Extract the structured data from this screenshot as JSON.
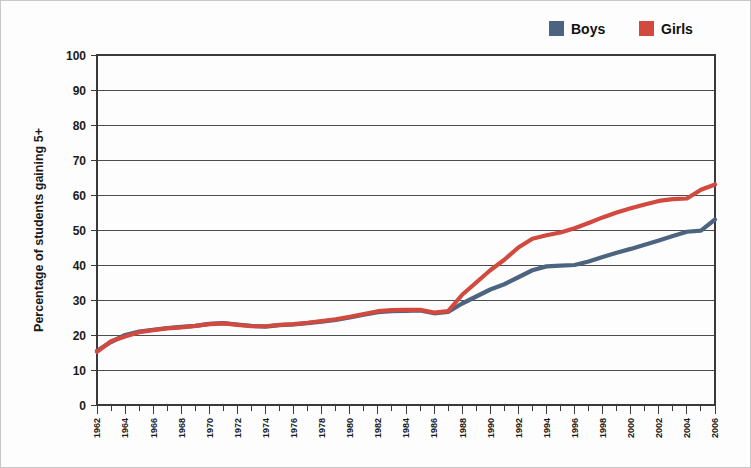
{
  "chart_data": {
    "type": "line",
    "title": "",
    "xlabel": "",
    "ylabel": "Percentage of students gaining 5+",
    "ylim": [
      0,
      100
    ],
    "xlim": [
      1962,
      2006
    ],
    "ytick_step": 10,
    "yticks": [
      0,
      10,
      20,
      30,
      40,
      50,
      60,
      70,
      80,
      90,
      100
    ],
    "grid": true,
    "legend_position": "top-right",
    "x": [
      1962,
      1963,
      1964,
      1965,
      1966,
      1967,
      1968,
      1969,
      1970,
      1971,
      1972,
      1973,
      1974,
      1975,
      1976,
      1977,
      1978,
      1979,
      1980,
      1981,
      1982,
      1983,
      1984,
      1985,
      1986,
      1987,
      1988,
      1989,
      1990,
      1991,
      1992,
      1993,
      1994,
      1995,
      1996,
      1997,
      1998,
      1999,
      2000,
      2001,
      2002,
      2003,
      2004,
      2005,
      2006
    ],
    "xticks_labeled": [
      "1962",
      "1964",
      "1966",
      "1968",
      "1970",
      "1972",
      "1974",
      "1976",
      "1978",
      "1980",
      "1982",
      "1984",
      "1986",
      "1988",
      "1990",
      "1992",
      "1994",
      "1996",
      "1998",
      "2000",
      "2002",
      "2004",
      "2006"
    ],
    "series": [
      {
        "name": "Boys",
        "color": "#4d6480",
        "values": [
          15.5,
          18.0,
          20.0,
          21.0,
          21.5,
          22.0,
          22.3,
          22.6,
          23.2,
          23.4,
          23.0,
          22.6,
          22.4,
          22.8,
          23.0,
          23.4,
          23.8,
          24.3,
          25.0,
          25.8,
          26.5,
          26.8,
          26.9,
          27.0,
          26.2,
          26.6,
          29.0,
          31.0,
          33.0,
          34.5,
          36.5,
          38.5,
          39.6,
          39.8,
          40.0,
          41.0,
          42.3,
          43.5,
          44.6,
          45.8,
          47.0,
          48.3,
          49.5,
          49.8,
          53.0
        ]
      },
      {
        "name": "Girls",
        "color": "#c7ララ",
        "values": [
          15.2,
          18.2,
          19.6,
          20.8,
          21.4,
          21.9,
          22.2,
          22.6,
          23.1,
          23.3,
          22.9,
          22.5,
          22.5,
          22.9,
          23.1,
          23.5,
          24.0,
          24.5,
          25.2,
          26.0,
          26.8,
          27.1,
          27.2,
          27.2,
          26.4,
          26.8,
          31.5,
          35.0,
          38.5,
          41.5,
          45.0,
          47.5,
          48.5,
          49.3,
          50.5,
          52.0,
          53.6,
          55.0,
          56.2,
          57.3,
          58.3,
          58.8,
          59.0,
          61.5,
          63.0
        ]
      }
    ]
  },
  "legend": {
    "items": [
      {
        "label": "Boys",
        "color": "#4d6480"
      },
      {
        "label": "Girls",
        "color": "#d1493f"
      }
    ]
  },
  "axes": {
    "y_title": "Percentage of students gaining 5+"
  }
}
